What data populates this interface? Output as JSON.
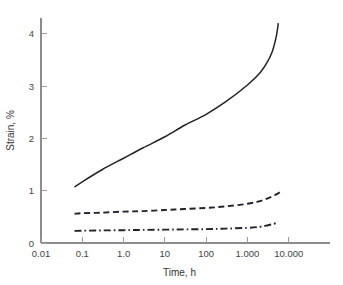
{
  "chart_data": {
    "type": "line",
    "title": "",
    "xlabel": "Time, h",
    "ylabel": "Strain, %",
    "xscale": "log",
    "yscale": "linear",
    "xlim": [
      0.01,
      100000
    ],
    "ylim": [
      0,
      4.3
    ],
    "grid": false,
    "legend": "none",
    "xticks": [
      0.01,
      0.1,
      1,
      10,
      100,
      1000,
      10000
    ],
    "xtick_labels": [
      "0.01",
      "0.1",
      "1.0",
      "10",
      "100",
      "1.000",
      "10.000"
    ],
    "yticks": [
      0,
      1,
      2,
      3,
      4
    ],
    "ytick_labels": [
      "0",
      "1",
      "2",
      "3",
      "4"
    ],
    "series": [
      {
        "name": "upper-curve",
        "style": "solid",
        "color": "#22222a",
        "x": [
          0.065,
          0.1,
          0.3,
          1.0,
          3.0,
          10,
          30,
          100,
          300,
          1000,
          2000,
          3000,
          4000,
          5000,
          5600
        ],
        "y": [
          1.07,
          1.17,
          1.4,
          1.62,
          1.82,
          2.03,
          2.25,
          2.46,
          2.7,
          3.02,
          3.25,
          3.45,
          3.66,
          3.95,
          4.2
        ]
      },
      {
        "name": "middle-curve",
        "style": "dashed",
        "color": "#22222a",
        "x": [
          0.065,
          0.1,
          0.3,
          1.0,
          3.0,
          10,
          30,
          100,
          300,
          1000,
          2000,
          3000,
          4000,
          5000,
          6200
        ],
        "y": [
          0.56,
          0.57,
          0.58,
          0.6,
          0.61,
          0.63,
          0.65,
          0.67,
          0.7,
          0.75,
          0.8,
          0.85,
          0.89,
          0.93,
          0.97
        ]
      },
      {
        "name": "lower-curve",
        "style": "dashdot",
        "color": "#22222a",
        "x": [
          0.065,
          0.1,
          0.3,
          1.0,
          3.0,
          10,
          30,
          100,
          300,
          1000,
          2000,
          3000,
          4000,
          5000
        ],
        "y": [
          0.23,
          0.235,
          0.24,
          0.245,
          0.25,
          0.255,
          0.26,
          0.265,
          0.275,
          0.29,
          0.31,
          0.335,
          0.36,
          0.38
        ]
      }
    ]
  },
  "geometry": {
    "plot_left": 41,
    "plot_right": 330,
    "plot_top": 18,
    "plot_bottom": 243,
    "decade_px": 40.5,
    "unit_px": 56.25
  },
  "styles": {
    "axis_color": "#8c8c8c",
    "curve_color": "#22222a",
    "text_color": "#333333",
    "background": "#ffffff"
  }
}
